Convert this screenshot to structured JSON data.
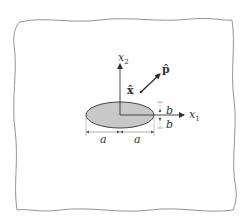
{
  "diagram": {
    "type": "elliptical-inclusion-in-infinite-plane",
    "colors": {
      "background": "#ffffff",
      "stroke": "#444444",
      "ellipse_fill": "#c8c8c8",
      "border": "#777777"
    },
    "axes": {
      "x1_label": "x",
      "x1_sub": "1",
      "x2_label": "x",
      "x2_sub": "2"
    },
    "vectors": {
      "x_hat_label": "x̂",
      "p_hat_label": "p̂"
    },
    "dimensions": {
      "semi_major_left": "a",
      "semi_major_right": "a",
      "semi_minor_top": "b",
      "semi_minor_bottom": "b"
    }
  }
}
